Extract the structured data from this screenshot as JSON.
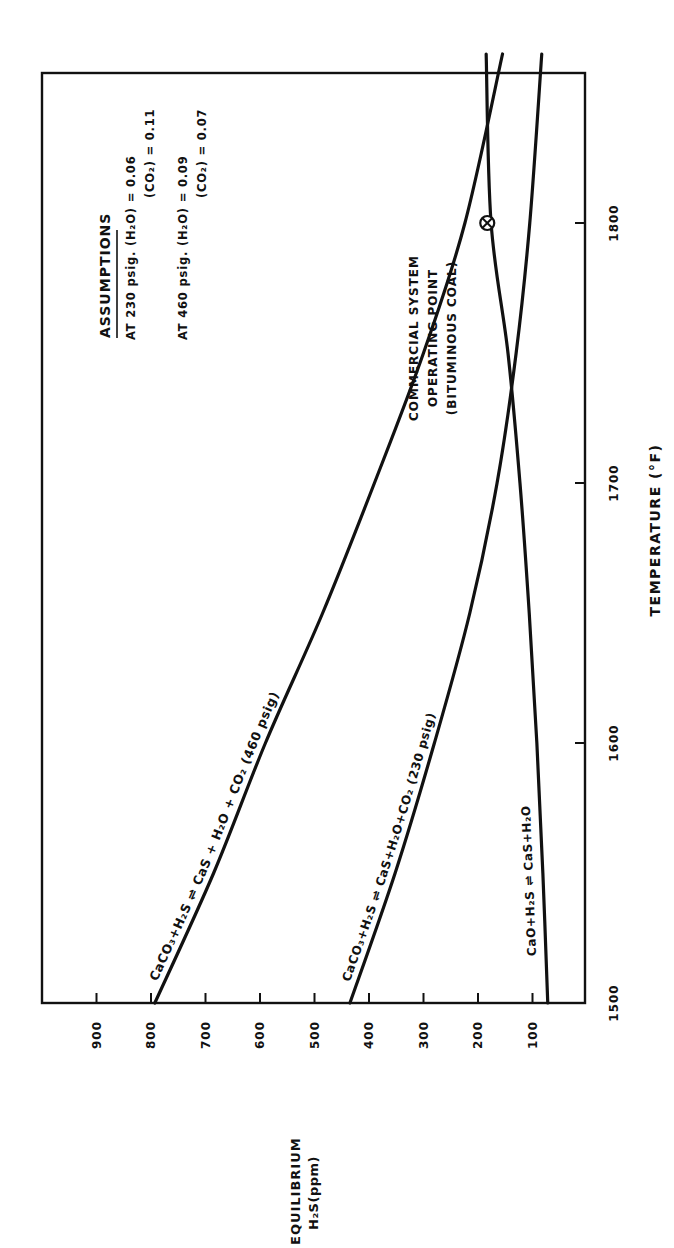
{
  "chart_data": {
    "type": "line",
    "orientation_note_visible": "rotated 90 degrees counter-clockwise on page",
    "title": "",
    "xlabel": "TEMPERATURE (°F)",
    "ylabel_line1": "EQUILIBRIUM",
    "ylabel_line2": "H₂S(ppm)",
    "x_ticks": [
      1500,
      1600,
      1700,
      1800
    ],
    "y_ticks": [
      100,
      200,
      300,
      400,
      500,
      600,
      700,
      800,
      900
    ],
    "xlim": [
      1500,
      1865
    ],
    "ylim": [
      0,
      990
    ],
    "grid": false,
    "x": [
      1500,
      1550,
      1600,
      1650,
      1700,
      1750,
      1800,
      1865
    ],
    "series": [
      {
        "name": "CaCO₃+H₂S ⇌ CaS + H₂O + CO₂ (460 psig)",
        "label_parts": [
          "CaCO₃+H₂S",
          "⇌",
          "CaS + H₂O + CO₂",
          "(460 psig)"
        ],
        "values": [
          793,
          685,
          590,
          485,
          390,
          300,
          224,
          155
        ]
      },
      {
        "name": "CaCO₃+H₂S ⇌ CaS+H₂O+CO₂ (230 psig)",
        "label_parts": [
          "CaCO₃+H₂S",
          "⇌",
          "CaS+H₂O+CO₂",
          "(230 psig)"
        ],
        "values": [
          435,
          352,
          280,
          215,
          165,
          130,
          105,
          83
        ]
      },
      {
        "name": "CaO+H₂S ⇌ CaS+H₂O",
        "label_parts": [
          "CaO+H₂S",
          "⇌",
          "CaS+H₂O"
        ],
        "values": [
          72,
          81,
          92,
          106,
          123,
          145,
          176,
          185
        ]
      }
    ],
    "annotations": {
      "operating_point": {
        "lines": [
          "COMMERCIAL SYSTEM",
          "OPERATING POINT",
          "(BITUMINOUS COAL)"
        ],
        "x": 1800,
        "y": 183
      },
      "assumptions": {
        "heading": "ASSUMPTIONS",
        "rows": [
          "AT 230 psig. (H₂O) = 0.06",
          "(CO₂) = 0.11",
          "AT 460 psig. (H₂O) = 0.09",
          "(CO₂) = 0.07"
        ]
      }
    }
  }
}
